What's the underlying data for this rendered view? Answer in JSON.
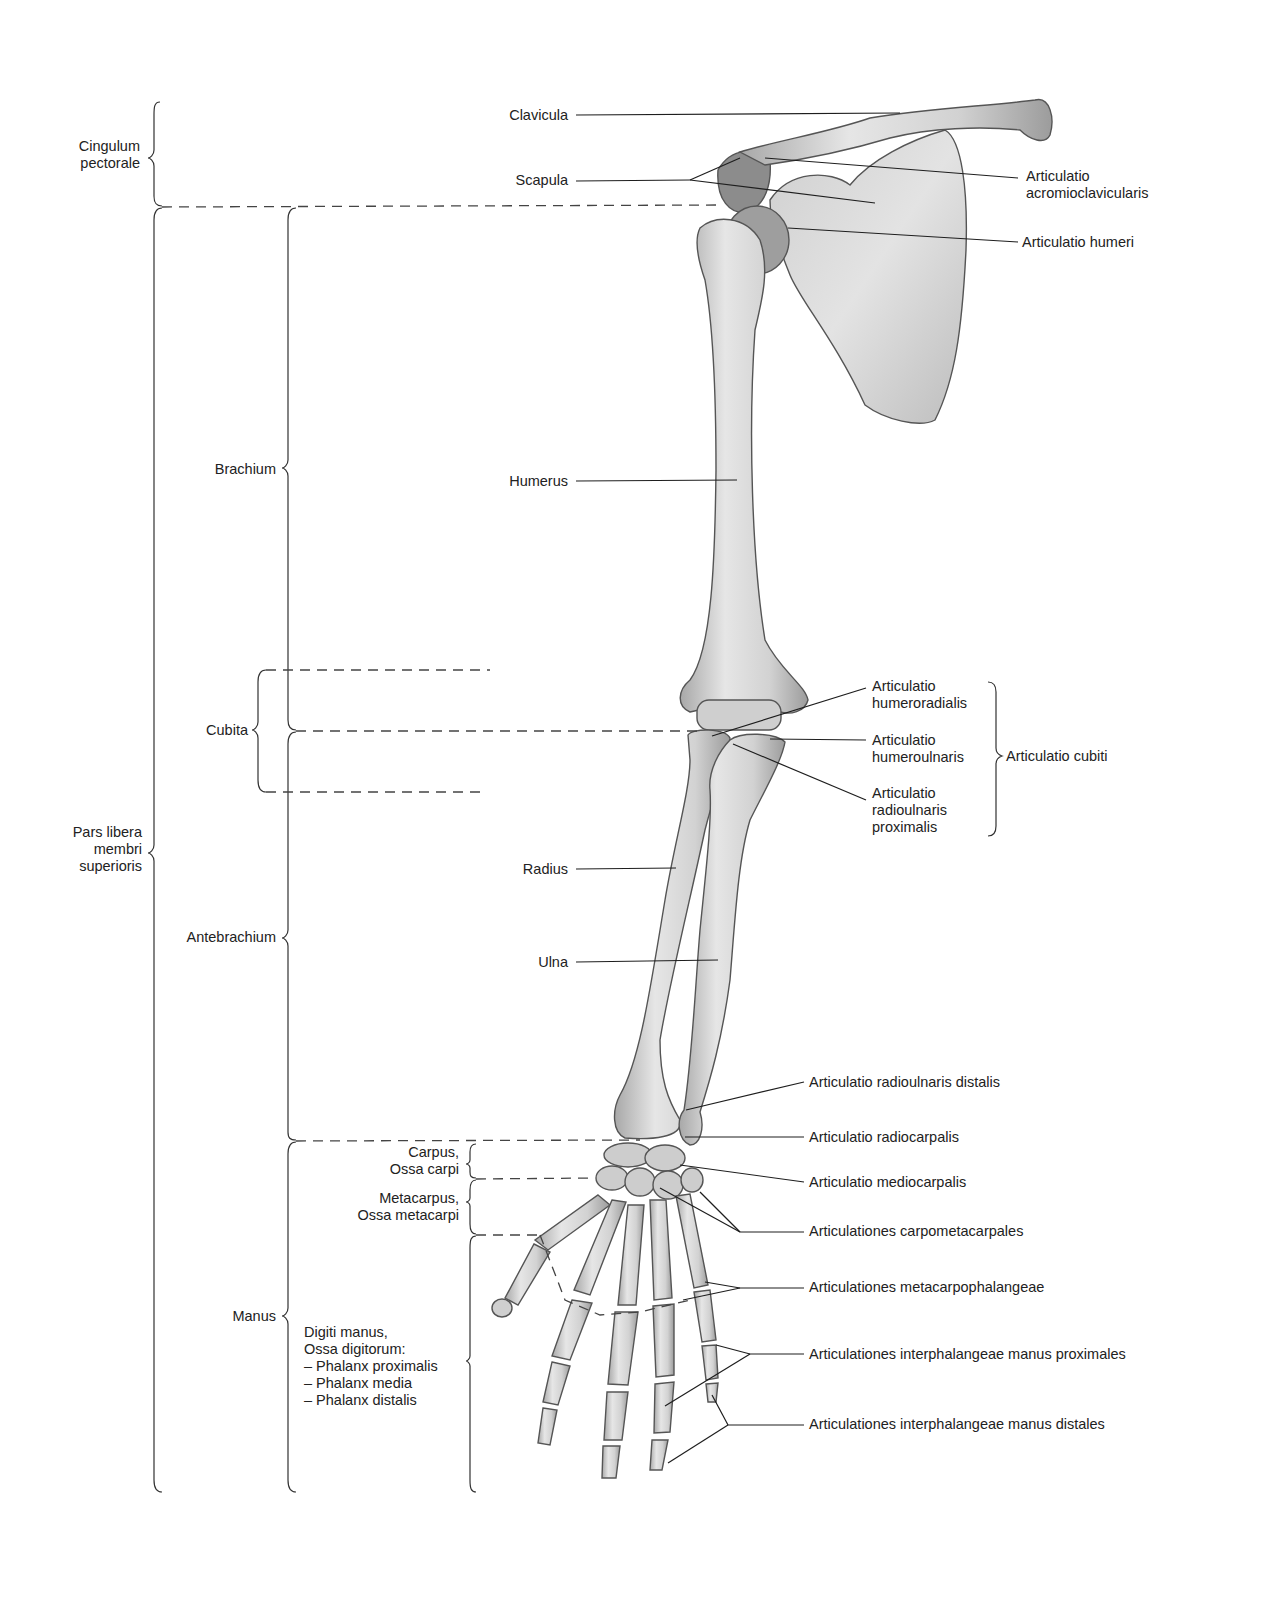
{
  "diagram": {
    "regions_left": {
      "cingulum": "Cingulum\npectorale",
      "pars_libera": "Pars libera\nmembri\nsuperioris",
      "brachium": "Brachium",
      "cubita": "Cubita",
      "antebrachium": "Antebrachium",
      "manus": "Manus",
      "carpus": "Carpus,\nOssa carpi",
      "metacarpus": "Metacarpus,\nOssa metacarpi",
      "digiti": "Digiti manus,\nOssa digitorum:\n– Phalanx proximalis\n– Phalanx media\n– Phalanx distalis"
    },
    "bones": {
      "clavicula": "Clavicula",
      "scapula": "Scapula",
      "humerus": "Humerus",
      "radius": "Radius",
      "ulna": "Ulna"
    },
    "joints": {
      "acromioclavicularis": "Articulatio\nacromioclavicularis",
      "humeri": "Articulatio humeri",
      "humeroradialis": "Articulatio\nhumeroradialis",
      "humeroulnaris": "Articulatio\nhumeroulnaris",
      "radioulnaris_proximalis": "Articulatio\nradioulnaris\nproximalis",
      "cubiti": "Articulatio cubiti",
      "radioulnaris_distalis": "Articulatio radioulnaris distalis",
      "radiocarpalis": "Articulatio radiocarpalis",
      "mediocarpalis": "Articulatio mediocarpalis",
      "carpometacarpales": "Articulationes carpometacarpales",
      "metacarpophalangeae": "Articulationes metacarpophalangeae",
      "interphalangeae_proximales": "Articulationes interphalangeae manus proximales",
      "interphalangeae_distales": "Articulationes interphalangeae manus distales"
    },
    "colors": {
      "bone_fill": "#d9d9d9",
      "bone_shade": "#9a9a9a",
      "bone_outline": "#555555",
      "line": "#222222",
      "dashed": "#444444"
    }
  }
}
